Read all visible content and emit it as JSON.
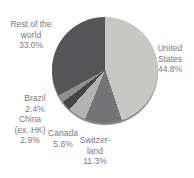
{
  "page": {
    "background_color": "#ffffff",
    "label_color": "#7b7b7b"
  },
  "chart_data": {
    "type": "pie",
    "title": "",
    "start_angle_deg": 0,
    "direction": "clockwise",
    "legend_position": "outside-labels",
    "rim_color": "#8a8a88",
    "slices": [
      {
        "label": "United States",
        "value": 44.8,
        "pct_label": "44.8%",
        "color": "#c7c8c4",
        "label_text": "United\nStates\n44.8%"
      },
      {
        "label": "Switzerland",
        "value": 11.3,
        "pct_label": "11.3%",
        "color": "#747476",
        "label_text": "Switzer-\nland\n11.3%"
      },
      {
        "label": "Canada",
        "value": 5.6,
        "pct_label": "5.6%",
        "color": "#b3b3b1",
        "label_text": "Canada\n5.6%"
      },
      {
        "label": "China (ex. HK)",
        "value": 2.9,
        "pct_label": "2.9%",
        "color": "#464646",
        "label_text": "China\n(ex. HK)\n2.9%"
      },
      {
        "label": "Brazil",
        "value": 2.4,
        "pct_label": "2.4%",
        "color": "#8f8f8d",
        "label_text": "Brazil\n2.4%"
      },
      {
        "label": "Rest of the world",
        "value": 33.0,
        "pct_label": "33.0%",
        "color": "#555557",
        "label_text": "Rest of the\nworld\n33.0%"
      }
    ]
  }
}
